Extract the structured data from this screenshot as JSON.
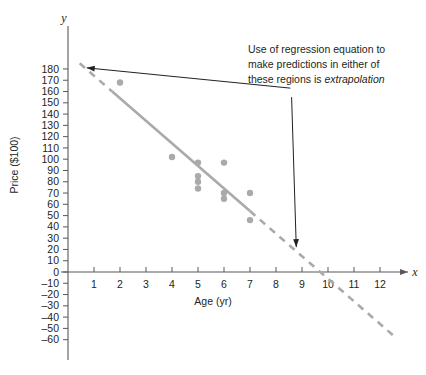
{
  "chart_data": {
    "type": "scatter",
    "title": "",
    "xlabel": "Age (yr)",
    "ylabel": "Price ($100)",
    "x_axis_letter": "x",
    "y_axis_letter": "y",
    "xlim": [
      0,
      13.2
    ],
    "ylim": [
      -65,
      186
    ],
    "grid": false,
    "legend": null,
    "xticks": [
      1,
      2,
      3,
      4,
      5,
      6,
      7,
      8,
      9,
      10,
      11,
      12
    ],
    "yticks": [
      180,
      170,
      160,
      150,
      140,
      130,
      120,
      110,
      100,
      90,
      80,
      70,
      60,
      50,
      40,
      30,
      20,
      10,
      0,
      -10,
      -20,
      -30,
      -40,
      -50,
      -60
    ],
    "xtick_labels": [
      "1",
      "2",
      "3",
      "4",
      "5",
      "6",
      "7",
      "8",
      "9",
      "10",
      "11",
      "12"
    ],
    "ytick_labels": [
      "180",
      "170",
      "160",
      "150",
      "140",
      "130",
      "120",
      "110",
      "100",
      "90",
      "80",
      "70",
      "60",
      "50",
      "40",
      "30",
      "20",
      "10",
      "0",
      "–10",
      "–20",
      "–30",
      "–40",
      "–50",
      "–60"
    ],
    "points": [
      {
        "x": 2.0,
        "y": 168
      },
      {
        "x": 4.0,
        "y": 102
      },
      {
        "x": 5.0,
        "y": 97
      },
      {
        "x": 5.0,
        "y": 85
      },
      {
        "x": 5.0,
        "y": 80
      },
      {
        "x": 5.0,
        "y": 74
      },
      {
        "x": 6.0,
        "y": 97
      },
      {
        "x": 6.0,
        "y": 70
      },
      {
        "x": 6.0,
        "y": 65
      },
      {
        "x": 7.0,
        "y": 70
      },
      {
        "x": 7.0,
        "y": 46
      }
    ],
    "point_color": "#aaaaaa",
    "point_radius": 3.2,
    "regression_line": {
      "slope": -20.0,
      "intercept": 194.0,
      "solid_segment": {
        "x_start": 1.7,
        "x_end": 7.0
      },
      "dashed_segments": [
        {
          "x_start": 0.45,
          "x_end": 1.7
        },
        {
          "x_start": 7.0,
          "x_end": 12.6
        }
      ],
      "x_intercept": 9.7,
      "color": "#aaaaaa"
    },
    "annotations": [
      {
        "name": "extrapolation-note",
        "lines": [
          "Use of regression equation to",
          "make predictions in either of",
          "these regions is "
        ],
        "emphasis_word": "extrapolation",
        "leader_lines": [
          {
            "from_x": 8.55,
            "from_y": 163,
            "to_x": 0.72,
            "to_y": 181
          },
          {
            "from_x": 8.6,
            "from_y": 155,
            "to_x": 8.78,
            "to_y": 22
          }
        ]
      }
    ]
  },
  "colors": {
    "axis": "#58595b",
    "data": "#aaaaaa",
    "text": "#231f20",
    "annotation_line": "#231f20",
    "background": "#ffffff"
  }
}
